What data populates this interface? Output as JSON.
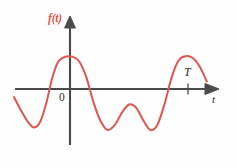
{
  "figure": {
    "kind": "function-plot",
    "background_color": "#fefefe",
    "axis_color": "#4a4a4a",
    "curve_color": "#e0564f",
    "label_color": "#2b2b2b"
  },
  "labels": {
    "function_label": "f(t)",
    "horizontal_axis_label": "t",
    "origin_label": "0",
    "period_label": "T"
  },
  "chart_data": {
    "type": "line",
    "title": "",
    "xlabel": "t",
    "ylabel": "f(t)",
    "grid": false,
    "legend": "none",
    "annotations": [
      {
        "text": "0",
        "role": "origin",
        "x": 0,
        "y": 0
      },
      {
        "text": "T",
        "role": "period-marker",
        "x": 1.0,
        "y": 0
      }
    ],
    "axis_origin_px": {
      "x": 70,
      "y": 89
    },
    "period_tick_px": {
      "x": 188,
      "y": 89
    },
    "xlim": [
      -0.48,
      1.18
    ],
    "ylim": [
      -0.78,
      0.62
    ],
    "series": [
      {
        "name": "f(t)",
        "color": "#e0564f",
        "x": [
          -0.475,
          -0.42,
          -0.36,
          -0.305,
          -0.25,
          -0.2,
          -0.15,
          -0.1,
          -0.04,
          0.02,
          0.08,
          0.14,
          0.2,
          0.26,
          0.32,
          0.38,
          0.44,
          0.5,
          0.56,
          0.62,
          0.68,
          0.74,
          0.8,
          0.86,
          0.92,
          0.98,
          1.04,
          1.1,
          1.16
        ],
        "y": [
          -0.13,
          -0.33,
          -0.52,
          -0.62,
          -0.52,
          -0.22,
          0.18,
          0.44,
          0.52,
          0.52,
          0.44,
          0.18,
          -0.22,
          -0.52,
          -0.66,
          -0.58,
          -0.38,
          -0.25,
          -0.3,
          -0.5,
          -0.66,
          -0.58,
          -0.25,
          0.18,
          0.46,
          0.53,
          0.5,
          0.36,
          0.12
        ]
      }
    ]
  }
}
